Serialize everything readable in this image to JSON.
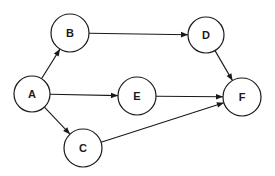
{
  "diagram": {
    "type": "directed-graph",
    "nodes": [
      {
        "id": "A",
        "label": "A",
        "cx": 32,
        "cy": 94,
        "r": 18
      },
      {
        "id": "B",
        "label": "B",
        "cx": 70,
        "cy": 33,
        "r": 19
      },
      {
        "id": "C",
        "label": "C",
        "cx": 83,
        "cy": 148,
        "r": 19
      },
      {
        "id": "D",
        "label": "D",
        "cx": 206,
        "cy": 35,
        "r": 18
      },
      {
        "id": "E",
        "label": "E",
        "cx": 137,
        "cy": 96,
        "r": 19
      },
      {
        "id": "F",
        "label": "F",
        "cx": 242,
        "cy": 97,
        "r": 19
      }
    ],
    "edges": [
      {
        "from": "A",
        "to": "B"
      },
      {
        "from": "A",
        "to": "E"
      },
      {
        "from": "A",
        "to": "C"
      },
      {
        "from": "B",
        "to": "D"
      },
      {
        "from": "D",
        "to": "F"
      },
      {
        "from": "E",
        "to": "F"
      },
      {
        "from": "C",
        "to": "F"
      }
    ],
    "colors": {
      "stroke": "#1a1a1a",
      "fill": "#ffffff"
    }
  }
}
